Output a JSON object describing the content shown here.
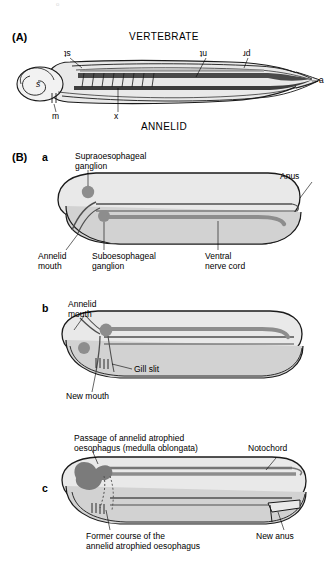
{
  "figure": {
    "panelA": {
      "tag": "(A)",
      "title_top": "VERTEBRATE",
      "title_bottom": "ANNELID",
      "labels": {
        "st": "st",
        "nt": "nt",
        "pr": "pr",
        "s": "s",
        "m": "m",
        "x": "x",
        "a": "a"
      }
    },
    "panelB": {
      "tag": "(B)",
      "stages": [
        {
          "tag": "a",
          "labels": {
            "supra": "Supraoesophageal\nganglion",
            "anus": "Anus",
            "mouth": "Annelid\nmouth",
            "sub": "Suboesophageal\nganglion",
            "cord": "Ventral\nnerve cord"
          }
        },
        {
          "tag": "b",
          "labels": {
            "mouth": "Annelid\nmouth",
            "gill": "Gill slit",
            "newmouth": "New mouth"
          }
        },
        {
          "tag": "c",
          "labels": {
            "passage": "Passage of annelid atrophied\noesophagus (medulla oblongata)",
            "notochord": "Notochord",
            "former": "Former course of the\nannelid atrophied oesophagus",
            "newanus": "New anus"
          }
        }
      ]
    },
    "colors": {
      "body_fill": "#e9e9e9",
      "body_fill_dark": "#d2d2d2",
      "nerve": "#8d8d8d",
      "nerve_dark": "#767676",
      "outline": "#1a1a1a",
      "leader": "#6e6e6e"
    }
  }
}
